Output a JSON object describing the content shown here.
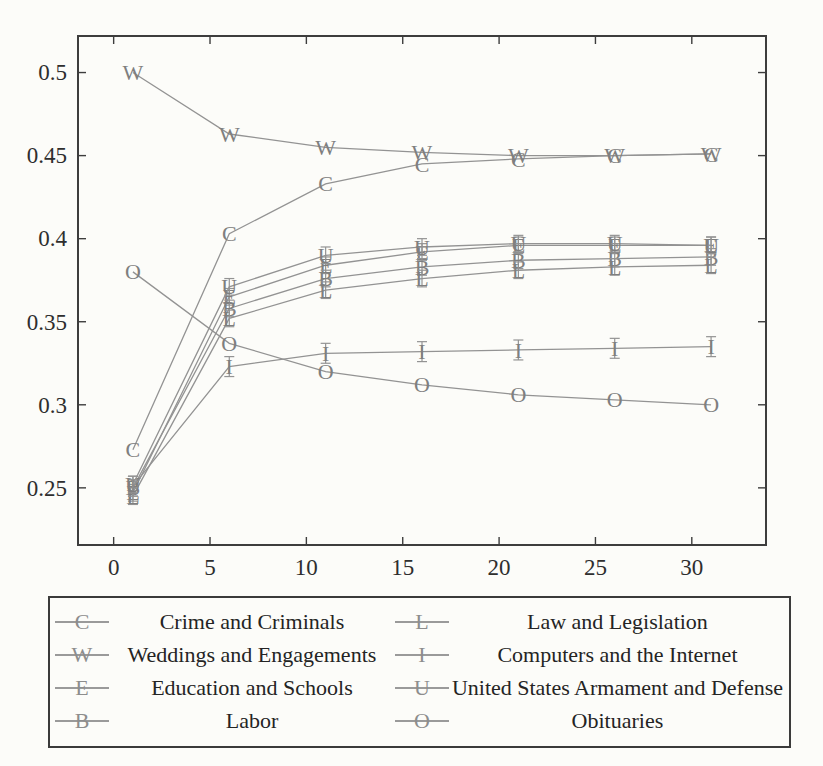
{
  "page": {
    "background": "#fcfcf9"
  },
  "chart_data": {
    "type": "line",
    "title": "",
    "xlabel": "",
    "ylabel": "",
    "grid": false,
    "legend_position": "below",
    "x": [
      1,
      6,
      11,
      16,
      21,
      26,
      31
    ],
    "series": [
      {
        "name": "Crime and Criminals",
        "marker": "C",
        "err": 0,
        "values": [
          0.273,
          0.403,
          0.433,
          0.445,
          0.448,
          0.45,
          0.451
        ]
      },
      {
        "name": "Weddings and Engagements",
        "marker": "W",
        "err": 0,
        "values": [
          0.5,
          0.463,
          0.455,
          0.452,
          0.45,
          0.45,
          0.451
        ]
      },
      {
        "name": "Education and Schools",
        "marker": "E",
        "err": 0.005,
        "values": [
          0.247,
          0.365,
          0.384,
          0.392,
          0.396,
          0.396,
          0.396
        ]
      },
      {
        "name": "Labor",
        "marker": "B",
        "err": 0.005,
        "values": [
          0.25,
          0.358,
          0.376,
          0.383,
          0.387,
          0.388,
          0.389
        ]
      },
      {
        "name": "Law and Legislation",
        "marker": "L",
        "err": 0.005,
        "values": [
          0.245,
          0.352,
          0.369,
          0.376,
          0.381,
          0.383,
          0.384
        ]
      },
      {
        "name": "Computers and the Internet",
        "marker": "I",
        "err": 0.006,
        "values": [
          0.251,
          0.323,
          0.331,
          0.332,
          0.333,
          0.334,
          0.335
        ]
      },
      {
        "name": "United States Armament and Defense",
        "marker": "U",
        "err": 0.005,
        "values": [
          0.252,
          0.371,
          0.39,
          0.395,
          0.397,
          0.397,
          0.396
        ]
      },
      {
        "name": "Obituaries",
        "marker": "O",
        "err": 0,
        "values": [
          0.38,
          0.337,
          0.32,
          0.312,
          0.306,
          0.303,
          0.3
        ]
      }
    ],
    "xticks": {
      "values": [
        0,
        5,
        10,
        15,
        20,
        25,
        30
      ],
      "labels": [
        "0",
        "5",
        "10",
        "15",
        "20",
        "25",
        "30"
      ]
    },
    "yticks": {
      "values": [
        0.25,
        0.3,
        0.35,
        0.4,
        0.45,
        0.5
      ],
      "labels": [
        "0.25",
        "0.3",
        "0.35",
        "0.4",
        "0.45",
        "0.5"
      ]
    },
    "xlim": [
      -1.85,
      33.85
    ],
    "ylim": [
      0.2156,
      0.522
    ],
    "axis_color": "#3d3d3d",
    "line_color": "#939393",
    "marker_color": "#7f7f7f",
    "label_color": "#2e2e2e"
  },
  "legend": {
    "items": [
      {
        "marker": "C",
        "label": "Crime and Criminals"
      },
      {
        "marker": "L",
        "label": "Law and Legislation"
      },
      {
        "marker": "W",
        "label": "Weddings and Engagements"
      },
      {
        "marker": "I",
        "label": "Computers and the Internet"
      },
      {
        "marker": "E",
        "label": "Education and Schools"
      },
      {
        "marker": "U",
        "label": "United States Armament and Defense"
      },
      {
        "marker": "B",
        "label": "Labor"
      },
      {
        "marker": "O",
        "label": "Obituaries"
      }
    ]
  }
}
